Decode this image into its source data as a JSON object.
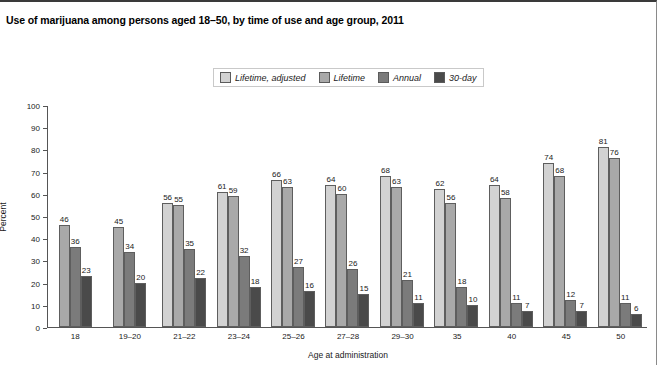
{
  "chart_data": {
    "type": "bar",
    "title": "Use of marijuana among persons aged 18–50, by time of use and age group, 2011",
    "xlabel": "Age at administration",
    "ylabel": "Percent",
    "ylim": [
      0,
      100
    ],
    "ytick_step": 10,
    "yticks": [
      "100",
      "90",
      "80",
      "70",
      "60",
      "50",
      "40",
      "30",
      "20",
      "10",
      "0"
    ],
    "grid": false,
    "legend_position": "top-center",
    "categories": [
      "18",
      "19–20",
      "21–22",
      "23–24",
      "25–26",
      "27–28",
      "29–30",
      "35",
      "40",
      "45",
      "50"
    ],
    "series": [
      {
        "name": "Lifetime, adjusted",
        "color": "#d2d2d2",
        "values": [
          null,
          null,
          56,
          61,
          66,
          64,
          68,
          62,
          64,
          74,
          81
        ]
      },
      {
        "name": "Lifetime",
        "color": "#a9a9a9",
        "values": [
          46,
          45,
          55,
          59,
          63,
          60,
          63,
          56,
          58,
          68,
          76
        ]
      },
      {
        "name": "Annual",
        "color": "#7b7b7b",
        "values": [
          36,
          34,
          35,
          32,
          27,
          26,
          21,
          18,
          11,
          12,
          11
        ]
      },
      {
        "name": "30-day",
        "color": "#4a4a4a",
        "values": [
          23,
          20,
          22,
          18,
          16,
          15,
          11,
          10,
          7,
          7,
          6
        ]
      }
    ]
  }
}
